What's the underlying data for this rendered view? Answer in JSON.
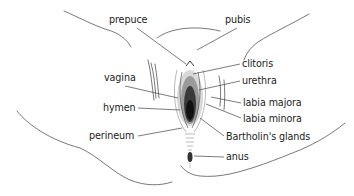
{
  "diagram": {
    "type": "labeled anatomical illustration",
    "line_color": "#444444",
    "text_color": "#222222",
    "labels": [
      {
        "id": "prepuce",
        "text": "prepuce",
        "x": 109,
        "y": 15
      },
      {
        "id": "pubis",
        "text": "pubis",
        "x": 225,
        "y": 15
      },
      {
        "id": "clitoris",
        "text": "clitoris",
        "x": 242,
        "y": 59
      },
      {
        "id": "urethra",
        "text": "urethra",
        "x": 242,
        "y": 76
      },
      {
        "id": "vagina",
        "text": "vagina",
        "x": 104,
        "y": 73
      },
      {
        "id": "labia_majora",
        "text": "labia majora",
        "x": 243,
        "y": 98
      },
      {
        "id": "labia_minora",
        "text": "labia minora",
        "x": 243,
        "y": 114
      },
      {
        "id": "hymen",
        "text": "hymen",
        "x": 103,
        "y": 103
      },
      {
        "id": "perineum",
        "text": "perineum",
        "x": 89,
        "y": 131
      },
      {
        "id": "bartholins_glands",
        "text": "Bartholin's glands",
        "x": 226,
        "y": 132
      },
      {
        "id": "anus",
        "text": "anus",
        "x": 226,
        "y": 152
      }
    ]
  }
}
